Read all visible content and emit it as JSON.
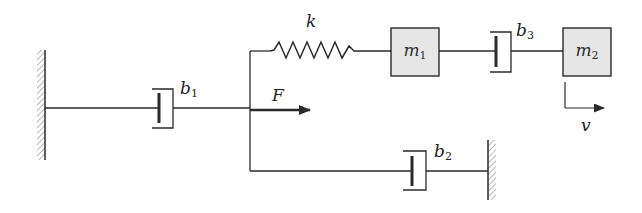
{
  "diagram": {
    "type": "mechanical-system-schematic",
    "colors": {
      "line": "#2a2a2a",
      "mass_fill": "#e6e6e6",
      "hatch": "#888888",
      "background": "#ffffff"
    },
    "labels": {
      "spring": "k",
      "damper1": {
        "base": "b",
        "sub": "1"
      },
      "damper2": {
        "base": "b",
        "sub": "2"
      },
      "damper3": {
        "base": "b",
        "sub": "3"
      },
      "mass1": {
        "base": "m",
        "sub": "1"
      },
      "mass2": {
        "base": "m",
        "sub": "2"
      },
      "force": "F",
      "velocity": "v"
    },
    "elements": [
      {
        "id": "wall-left",
        "kind": "fixed-wall"
      },
      {
        "id": "b1",
        "kind": "damper",
        "connects": [
          "wall-left",
          "node"
        ]
      },
      {
        "id": "F",
        "kind": "applied-force",
        "at": "node",
        "direction": "right"
      },
      {
        "id": "k",
        "kind": "spring",
        "connects": [
          "node",
          "m1"
        ]
      },
      {
        "id": "m1",
        "kind": "mass"
      },
      {
        "id": "b3",
        "kind": "damper",
        "connects": [
          "m1",
          "m2"
        ]
      },
      {
        "id": "m2",
        "kind": "mass"
      },
      {
        "id": "v",
        "kind": "velocity-indicator",
        "at": "m2",
        "direction": "right"
      },
      {
        "id": "b2",
        "kind": "damper",
        "connects": [
          "node",
          "wall-right"
        ]
      },
      {
        "id": "wall-right",
        "kind": "fixed-wall"
      }
    ]
  }
}
